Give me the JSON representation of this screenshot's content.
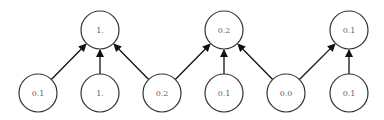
{
  "diagram": {
    "type": "tree-network",
    "node_radius": 19,
    "colors": {
      "stroke": "#333333",
      "text": "#666666",
      "arrow": "#111111",
      "background": "#ffffff"
    },
    "top_nodes": [
      {
        "id": "t0",
        "label": "1.",
        "x": 100,
        "y": 30
      },
      {
        "id": "t1",
        "label": "0.2",
        "x": 224,
        "y": 30
      },
      {
        "id": "t2",
        "label": "0.1",
        "x": 349,
        "y": 30
      }
    ],
    "bottom_nodes": [
      {
        "id": "b0",
        "label": "0.1",
        "x": 38,
        "y": 93
      },
      {
        "id": "b1",
        "label": "1.",
        "x": 100,
        "y": 93
      },
      {
        "id": "b2",
        "label": "0.2",
        "x": 162,
        "y": 93
      },
      {
        "id": "b3",
        "label": "0.1",
        "x": 224,
        "y": 93
      },
      {
        "id": "b4",
        "label": "0.0",
        "x": 286,
        "y": 93
      },
      {
        "id": "b5",
        "label": "0.1",
        "x": 349,
        "y": 93
      }
    ],
    "edges": [
      {
        "from": "b0",
        "to": "t0"
      },
      {
        "from": "b1",
        "to": "t0"
      },
      {
        "from": "b2",
        "to": "t0"
      },
      {
        "from": "b2",
        "to": "t1"
      },
      {
        "from": "b3",
        "to": "t1"
      },
      {
        "from": "b4",
        "to": "t1"
      },
      {
        "from": "b4",
        "to": "t2"
      },
      {
        "from": "b5",
        "to": "t2"
      }
    ]
  }
}
